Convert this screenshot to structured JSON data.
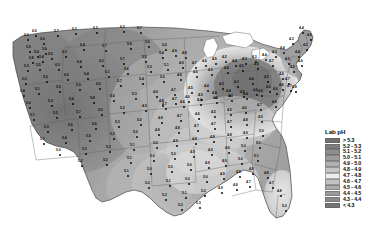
{
  "figure": {
    "kind": "choropleth-map",
    "region": "Contiguous United States",
    "measure": "Lab pH"
  },
  "legend": {
    "title": "Lab pH",
    "entries": [
      {
        "label": "> 5.3",
        "color": "#6e6e6e",
        "min": 5.3,
        "max": null
      },
      {
        "label": "5.2 - 5.3",
        "color": "#7d7d7d",
        "min": 5.2,
        "max": 5.3
      },
      {
        "label": "5.1 - 5.2",
        "color": "#8d8d8d",
        "min": 5.1,
        "max": 5.2
      },
      {
        "label": "5.0 - 5.1",
        "color": "#9d9d9d",
        "min": 5.0,
        "max": 5.1
      },
      {
        "label": "4.9 - 5.0",
        "color": "#b0b0b0",
        "min": 4.9,
        "max": 5.0
      },
      {
        "label": "4.8 - 4.9",
        "color": "#c6c6c6",
        "min": 4.8,
        "max": 4.9
      },
      {
        "label": "4.7 - 4.8",
        "color": "#ececec",
        "min": 4.7,
        "max": 4.8
      },
      {
        "label": "4.6 - 4.7",
        "color": "#c2c2c2",
        "min": 4.6,
        "max": 4.7
      },
      {
        "label": "4.5 - 4.6",
        "color": "#ababab",
        "min": 4.5,
        "max": 4.6
      },
      {
        "label": "4.4 - 4.5",
        "color": "#9a9a9a",
        "min": 4.4,
        "max": 4.5
      },
      {
        "label": "4.3 - 4.4",
        "color": "#8a8a8a",
        "min": 4.3,
        "max": 4.4
      },
      {
        "label": "< 4.3",
        "color": "#757575",
        "min": null,
        "max": 4.3
      }
    ]
  },
  "chart_data": {
    "type": "heatmap",
    "title": "Lab pH",
    "xlabel": "",
    "ylabel": "",
    "legend_position": "right",
    "grid": false,
    "value_range": [
      4.2,
      6.4
    ],
    "station_labels": [
      {
        "v": "6.0",
        "x": 28,
        "y": 40
      },
      {
        "v": "6.0",
        "x": 36,
        "y": 36
      },
      {
        "v": "5.6",
        "x": 44,
        "y": 44
      },
      {
        "v": "5.7",
        "x": 58,
        "y": 36
      },
      {
        "v": "6.3",
        "x": 76,
        "y": 34
      },
      {
        "v": "6.3",
        "x": 97,
        "y": 33
      },
      {
        "v": "6.2",
        "x": 124,
        "y": 32
      },
      {
        "v": "5.7",
        "x": 141,
        "y": 33
      },
      {
        "v": "5.5",
        "x": 30,
        "y": 52
      },
      {
        "v": "5.4",
        "x": 38,
        "y": 57
      },
      {
        "v": "5.6",
        "x": 46,
        "y": 54
      },
      {
        "v": "5.8",
        "x": 33,
        "y": 63
      },
      {
        "v": "5.4",
        "x": 43,
        "y": 62
      },
      {
        "v": "5.5",
        "x": 52,
        "y": 59
      },
      {
        "v": "6.3",
        "x": 66,
        "y": 57
      },
      {
        "v": "6.4",
        "x": 84,
        "y": 50
      },
      {
        "v": "5.7",
        "x": 106,
        "y": 51
      },
      {
        "v": "5.8",
        "x": 131,
        "y": 49
      },
      {
        "v": "5.6",
        "x": 149,
        "y": 47
      },
      {
        "v": "5.3",
        "x": 28,
        "y": 71
      },
      {
        "v": "5.5",
        "x": 40,
        "y": 70
      },
      {
        "v": "6.3",
        "x": 59,
        "y": 70
      },
      {
        "v": "6.4",
        "x": 81,
        "y": 67
      },
      {
        "v": "6.2",
        "x": 103,
        "y": 66
      },
      {
        "v": "5.7",
        "x": 124,
        "y": 64
      },
      {
        "v": "5.5",
        "x": 146,
        "y": 62
      },
      {
        "v": "5.4",
        "x": 163,
        "y": 58
      },
      {
        "v": "5.2",
        "x": 26,
        "y": 84
      },
      {
        "v": "5.6",
        "x": 47,
        "y": 82
      },
      {
        "v": "6.0",
        "x": 68,
        "y": 80
      },
      {
        "v": "6.4",
        "x": 88,
        "y": 79
      },
      {
        "v": "6.1",
        "x": 109,
        "y": 77
      },
      {
        "v": "5.6",
        "x": 128,
        "y": 74
      },
      {
        "v": "5.3",
        "x": 151,
        "y": 72
      },
      {
        "v": "5.1",
        "x": 168,
        "y": 70
      },
      {
        "v": "4.9",
        "x": 183,
        "y": 68
      },
      {
        "v": "5.4",
        "x": 24,
        "y": 96
      },
      {
        "v": "5.1",
        "x": 39,
        "y": 94
      },
      {
        "v": "5.5",
        "x": 60,
        "y": 92
      },
      {
        "v": "5.9",
        "x": 80,
        "y": 90
      },
      {
        "v": "6.0",
        "x": 100,
        "y": 89
      },
      {
        "v": "5.7",
        "x": 121,
        "y": 86
      },
      {
        "v": "5.4",
        "x": 143,
        "y": 84
      },
      {
        "v": "5.0",
        "x": 164,
        "y": 82
      },
      {
        "v": "4.8",
        "x": 181,
        "y": 80
      },
      {
        "v": "4.6",
        "x": 197,
        "y": 77
      },
      {
        "v": "4.5",
        "x": 212,
        "y": 75
      },
      {
        "v": "4.4",
        "x": 228,
        "y": 73
      },
      {
        "v": "4.5",
        "x": 243,
        "y": 71
      },
      {
        "v": "4.6",
        "x": 258,
        "y": 69
      },
      {
        "v": "4.7",
        "x": 273,
        "y": 66
      },
      {
        "v": "5.0",
        "x": 30,
        "y": 108
      },
      {
        "v": "5.3",
        "x": 52,
        "y": 106
      },
      {
        "v": "5.6",
        "x": 73,
        "y": 104
      },
      {
        "v": "5.8",
        "x": 94,
        "y": 103
      },
      {
        "v": "5.6",
        "x": 114,
        "y": 101
      },
      {
        "v": "5.3",
        "x": 136,
        "y": 99
      },
      {
        "v": "4.9",
        "x": 157,
        "y": 97
      },
      {
        "v": "4.7",
        "x": 175,
        "y": 95
      },
      {
        "v": "4.5",
        "x": 192,
        "y": 93
      },
      {
        "v": "4.4",
        "x": 208,
        "y": 91
      },
      {
        "v": "4.3",
        "x": 223,
        "y": 89
      },
      {
        "v": "4.3",
        "x": 238,
        "y": 87
      },
      {
        "v": "4.4",
        "x": 253,
        "y": 84
      },
      {
        "v": "4.5",
        "x": 268,
        "y": 82
      },
      {
        "v": "4.6",
        "x": 283,
        "y": 79
      },
      {
        "v": "5.1",
        "x": 34,
        "y": 120
      },
      {
        "v": "5.5",
        "x": 57,
        "y": 118
      },
      {
        "v": "5.7",
        "x": 80,
        "y": 117
      },
      {
        "v": "5.5",
        "x": 102,
        "y": 115
      },
      {
        "v": "5.2",
        "x": 124,
        "y": 113
      },
      {
        "v": "4.9",
        "x": 146,
        "y": 111
      },
      {
        "v": "4.7",
        "x": 166,
        "y": 109
      },
      {
        "v": "4.6",
        "x": 184,
        "y": 107
      },
      {
        "v": "4.4",
        "x": 201,
        "y": 105
      },
      {
        "v": "4.3",
        "x": 217,
        "y": 103
      },
      {
        "v": "4.3",
        "x": 232,
        "y": 101
      },
      {
        "v": "4.4",
        "x": 247,
        "y": 99
      },
      {
        "v": "4.5",
        "x": 262,
        "y": 96
      },
      {
        "v": "4.6",
        "x": 277,
        "y": 94
      },
      {
        "v": "4.7",
        "x": 291,
        "y": 91
      },
      {
        "v": "5.3",
        "x": 48,
        "y": 132
      },
      {
        "v": "5.6",
        "x": 72,
        "y": 130
      },
      {
        "v": "5.6",
        "x": 96,
        "y": 129
      },
      {
        "v": "5.3",
        "x": 119,
        "y": 127
      },
      {
        "v": "5.0",
        "x": 141,
        "y": 125
      },
      {
        "v": "4.8",
        "x": 162,
        "y": 123
      },
      {
        "v": "4.7",
        "x": 181,
        "y": 121
      },
      {
        "v": "4.6",
        "x": 199,
        "y": 119
      },
      {
        "v": "4.5",
        "x": 215,
        "y": 117
      },
      {
        "v": "4.5",
        "x": 231,
        "y": 115
      },
      {
        "v": "4.6",
        "x": 246,
        "y": 113
      },
      {
        "v": "4.7",
        "x": 261,
        "y": 110
      },
      {
        "v": "4.8",
        "x": 276,
        "y": 107
      },
      {
        "v": "5.1",
        "x": 44,
        "y": 144
      },
      {
        "v": "5.4",
        "x": 66,
        "y": 143
      },
      {
        "v": "5.5",
        "x": 90,
        "y": 141
      },
      {
        "v": "5.2",
        "x": 114,
        "y": 139
      },
      {
        "v": "5.0",
        "x": 137,
        "y": 137
      },
      {
        "v": "4.9",
        "x": 159,
        "y": 135
      },
      {
        "v": "4.8",
        "x": 179,
        "y": 133
      },
      {
        "v": "4.7",
        "x": 198,
        "y": 131
      },
      {
        "v": "4.7",
        "x": 215,
        "y": 129
      },
      {
        "v": "4.7",
        "x": 231,
        "y": 127
      },
      {
        "v": "4.8",
        "x": 247,
        "y": 125
      },
      {
        "v": "4.9",
        "x": 262,
        "y": 122
      },
      {
        "v": "5.0",
        "x": 60,
        "y": 155
      },
      {
        "v": "5.3",
        "x": 86,
        "y": 154
      },
      {
        "v": "5.3",
        "x": 110,
        "y": 152
      },
      {
        "v": "5.1",
        "x": 134,
        "y": 150
      },
      {
        "v": "5.0",
        "x": 157,
        "y": 148
      },
      {
        "v": "4.9",
        "x": 177,
        "y": 146
      },
      {
        "v": "4.8",
        "x": 196,
        "y": 144
      },
      {
        "v": "4.8",
        "x": 214,
        "y": 142
      },
      {
        "v": "4.8",
        "x": 231,
        "y": 140
      },
      {
        "v": "4.9",
        "x": 247,
        "y": 138
      },
      {
        "v": "5.0",
        "x": 263,
        "y": 136
      },
      {
        "v": "5.2",
        "x": 82,
        "y": 166
      },
      {
        "v": "5.2",
        "x": 107,
        "y": 165
      },
      {
        "v": "5.1",
        "x": 131,
        "y": 163
      },
      {
        "v": "5.0",
        "x": 154,
        "y": 161
      },
      {
        "v": "5.0",
        "x": 175,
        "y": 159
      },
      {
        "v": "4.9",
        "x": 194,
        "y": 157
      },
      {
        "v": "4.9",
        "x": 212,
        "y": 155
      },
      {
        "v": "4.9",
        "x": 229,
        "y": 153
      },
      {
        "v": "5.0",
        "x": 245,
        "y": 151
      },
      {
        "v": "5.1",
        "x": 260,
        "y": 148
      },
      {
        "v": "5.1",
        "x": 128,
        "y": 176
      },
      {
        "v": "5.0",
        "x": 151,
        "y": 174
      },
      {
        "v": "5.0",
        "x": 172,
        "y": 172
      },
      {
        "v": "5.0",
        "x": 191,
        "y": 170
      },
      {
        "v": "4.9",
        "x": 209,
        "y": 168
      },
      {
        "v": "4.9",
        "x": 226,
        "y": 166
      },
      {
        "v": "5.0",
        "x": 242,
        "y": 164
      },
      {
        "v": "5.1",
        "x": 258,
        "y": 161
      },
      {
        "v": "5.2",
        "x": 149,
        "y": 188
      },
      {
        "v": "5.1",
        "x": 170,
        "y": 186
      },
      {
        "v": "5.0",
        "x": 189,
        "y": 184
      },
      {
        "v": "5.0",
        "x": 207,
        "y": 182
      },
      {
        "v": "4.9",
        "x": 224,
        "y": 179
      },
      {
        "v": "4.8",
        "x": 240,
        "y": 177
      },
      {
        "v": "4.8",
        "x": 253,
        "y": 174
      },
      {
        "v": "5.2",
        "x": 166,
        "y": 200
      },
      {
        "v": "5.1",
        "x": 186,
        "y": 198
      },
      {
        "v": "5.2",
        "x": 205,
        "y": 196
      },
      {
        "v": "4.9",
        "x": 222,
        "y": 193
      },
      {
        "v": "4.8",
        "x": 237,
        "y": 190
      },
      {
        "v": "4.7",
        "x": 250,
        "y": 187
      },
      {
        "v": "5.2",
        "x": 182,
        "y": 210
      },
      {
        "v": "5.3",
        "x": 200,
        "y": 208
      },
      {
        "v": "4.8",
        "x": 268,
        "y": 178
      },
      {
        "v": "4.7",
        "x": 273,
        "y": 188
      },
      {
        "v": "4.8",
        "x": 281,
        "y": 196
      },
      {
        "v": "5.2",
        "x": 286,
        "y": 211
      },
      {
        "v": "4.5",
        "x": 289,
        "y": 64
      },
      {
        "v": "4.4",
        "x": 299,
        "y": 57
      },
      {
        "v": "4.5",
        "x": 307,
        "y": 50
      },
      {
        "v": "4.6",
        "x": 311,
        "y": 40
      },
      {
        "v": "4.4",
        "x": 303,
        "y": 33
      },
      {
        "v": "4.3",
        "x": 293,
        "y": 44
      },
      {
        "v": "4.4",
        "x": 284,
        "y": 53
      },
      {
        "v": "4.5",
        "x": 294,
        "y": 72
      },
      {
        "v": "4.6",
        "x": 302,
        "y": 66
      },
      {
        "v": "4.3",
        "x": 276,
        "y": 57
      },
      {
        "v": "4.4",
        "x": 266,
        "y": 60
      },
      {
        "v": "4.3",
        "x": 256,
        "y": 62
      },
      {
        "v": "4.3",
        "x": 246,
        "y": 64
      },
      {
        "v": "4.4",
        "x": 236,
        "y": 66
      },
      {
        "v": "4.5",
        "x": 226,
        "y": 62
      },
      {
        "v": "4.5",
        "x": 216,
        "y": 64
      },
      {
        "v": "4.6",
        "x": 206,
        "y": 66
      },
      {
        "v": "4.7",
        "x": 196,
        "y": 68
      },
      {
        "v": "4.8",
        "x": 186,
        "y": 58
      },
      {
        "v": "4.9",
        "x": 176,
        "y": 56
      },
      {
        "v": "5.0",
        "x": 166,
        "y": 50
      },
      {
        "v": "4.7",
        "x": 289,
        "y": 84
      },
      {
        "v": "4.8",
        "x": 296,
        "y": 92
      },
      {
        "v": "4.6",
        "x": 283,
        "y": 90
      },
      {
        "v": "4.5",
        "x": 270,
        "y": 92
      },
      {
        "v": "4.6",
        "x": 257,
        "y": 95
      },
      {
        "v": "4.5",
        "x": 244,
        "y": 97
      },
      {
        "v": "4.4",
        "x": 230,
        "y": 96
      },
      {
        "v": "4.4",
        "x": 216,
        "y": 98
      },
      {
        "v": "4.5",
        "x": 202,
        "y": 100
      },
      {
        "v": "4.6",
        "x": 189,
        "y": 102
      },
      {
        "v": "4.7",
        "x": 176,
        "y": 104
      },
      {
        "v": "4.8",
        "x": 163,
        "y": 106
      }
    ]
  }
}
